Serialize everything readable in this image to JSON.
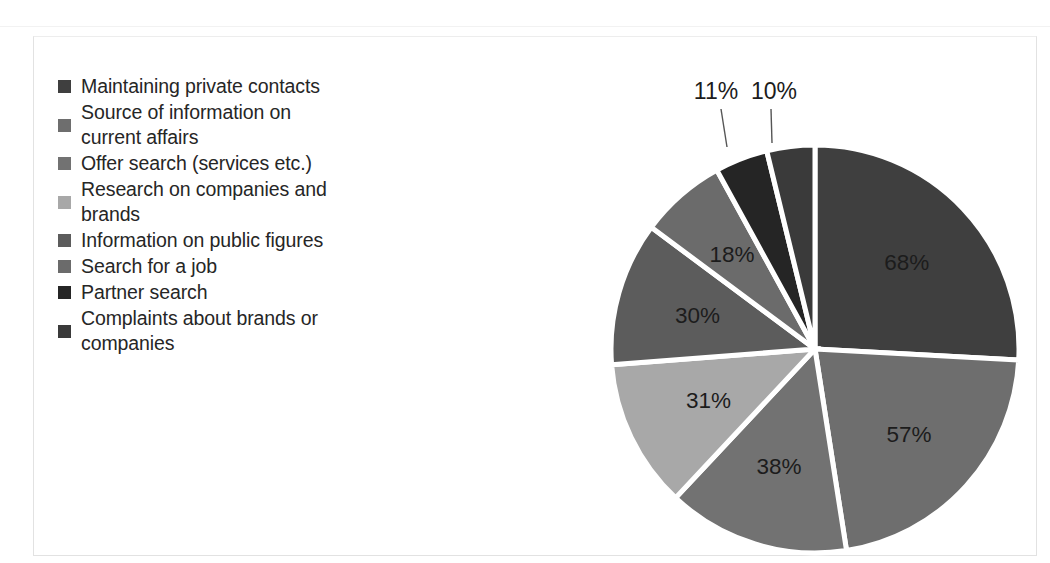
{
  "chart_data": {
    "type": "pie",
    "title": "",
    "subtitle": "",
    "xlabel": "",
    "ylabel": "",
    "legend_position": "left",
    "grid": false,
    "note": "Multi-response survey: shares sum to 263%, each slice drawn proportional to its share of the total",
    "total": 263,
    "categories": [
      "Maintaining private contacts",
      "Source of information on current affairs",
      "Offer search (services etc.)",
      "Research on companies and brands",
      "Information on public figures",
      "Search for a job",
      "Partner search",
      "Complaints about brands or companies"
    ],
    "values": [
      68,
      57,
      38,
      31,
      30,
      18,
      11,
      10
    ],
    "labels": [
      "68%",
      "57%",
      "38%",
      "31%",
      "30%",
      "18%",
      "11%",
      "10%"
    ],
    "colors": [
      "#3f3f3f",
      "#6e6e6e",
      "#727272",
      "#a8a8a8",
      "#5c5c5c",
      "#6b6b6b",
      "#252525",
      "#3a3a3a"
    ],
    "slices": [
      {
        "label": "68%",
        "value": 68,
        "category": "Maintaining private contacts",
        "color": "#3f3f3f",
        "label_placement": "inside"
      },
      {
        "label": "57%",
        "value": 57,
        "category": "Source of information on current affairs",
        "color": "#6e6e6e",
        "label_placement": "inside"
      },
      {
        "label": "38%",
        "value": 38,
        "category": "Offer search (services etc.)",
        "color": "#727272",
        "label_placement": "inside"
      },
      {
        "label": "31%",
        "value": 31,
        "category": "Research on companies and brands",
        "color": "#a8a8a8",
        "label_placement": "inside"
      },
      {
        "label": "30%",
        "value": 30,
        "category": "Information on public figures",
        "color": "#5c5c5c",
        "label_placement": "inside"
      },
      {
        "label": "18%",
        "value": 18,
        "category": "Search for a job",
        "color": "#6b6b6b",
        "label_placement": "inside"
      },
      {
        "label": "11%",
        "value": 11,
        "category": "Partner search",
        "color": "#252525",
        "label_placement": "outside-leader"
      },
      {
        "label": "10%",
        "value": 10,
        "category": "Complaints about brands or companies",
        "color": "#3a3a3a",
        "label_placement": "outside-leader"
      }
    ]
  },
  "legend": {
    "items": [
      {
        "label": "Maintaining private contacts",
        "color": "#3f3f3f"
      },
      {
        "label": "Source of information on\ncurrent affairs",
        "color": "#6e6e6e"
      },
      {
        "label": "Offer search (services etc.)",
        "color": "#727272"
      },
      {
        "label": "Research on companies and\nbrands",
        "color": "#a8a8a8"
      },
      {
        "label": "Information on public figures",
        "color": "#5c5c5c"
      },
      {
        "label": "Search for a job",
        "color": "#6b6b6b"
      },
      {
        "label": "Partner search",
        "color": "#252525"
      },
      {
        "label": "Complaints about brands or\ncompanies",
        "color": "#3a3a3a"
      }
    ]
  }
}
